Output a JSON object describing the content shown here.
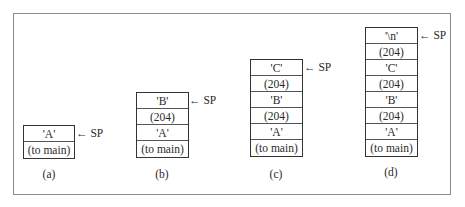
{
  "diagram": {
    "pointer_label": "← SP",
    "stacks": [
      {
        "caption": "(a)",
        "cells": [
          "'A'",
          "(to main)"
        ]
      },
      {
        "caption": "(b)",
        "cells": [
          "'B'",
          "(204)",
          "'A'",
          "(to main)"
        ]
      },
      {
        "caption": "(c)",
        "cells": [
          "'C'",
          "(204)",
          "'B'",
          "(204)",
          "'A'",
          "(to main)"
        ]
      },
      {
        "caption": "(d)",
        "cells": [
          "'\\n'",
          "(204)",
          "'C'",
          "(204)",
          "'B'",
          "(204)",
          "'A'",
          "(to main)"
        ]
      }
    ]
  }
}
